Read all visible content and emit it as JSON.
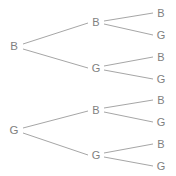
{
  "diagram": {
    "type": "binary-probability-tree",
    "background_color": "#ffffff",
    "text_color": "#7f7f7f",
    "edge_color": "#a6a6a6",
    "depth": 2,
    "branching_factor": 2,
    "outcome_symbols": [
      "B",
      "G"
    ],
    "nodes": [
      {
        "id": "r1",
        "label": "B",
        "level": 0,
        "x": 14,
        "y": 46,
        "class": "node-root"
      },
      {
        "id": "r2",
        "label": "G",
        "level": 0,
        "x": 14,
        "y": 130,
        "class": "node-root"
      },
      {
        "id": "m1",
        "label": "B",
        "level": 1,
        "x": 96,
        "y": 22,
        "class": "node-mid"
      },
      {
        "id": "m2",
        "label": "G",
        "level": 1,
        "x": 96,
        "y": 68,
        "class": "node-mid"
      },
      {
        "id": "m3",
        "label": "B",
        "level": 1,
        "x": 96,
        "y": 110,
        "class": "node-mid"
      },
      {
        "id": "m4",
        "label": "G",
        "level": 1,
        "x": 96,
        "y": 155,
        "class": "node-mid"
      },
      {
        "id": "l1",
        "label": "B",
        "level": 2,
        "x": 161,
        "y": 13,
        "class": "node-leaf"
      },
      {
        "id": "l2",
        "label": "G",
        "level": 2,
        "x": 161,
        "y": 35,
        "class": "node-leaf"
      },
      {
        "id": "l3",
        "label": "B",
        "level": 2,
        "x": 161,
        "y": 57,
        "class": "node-leaf"
      },
      {
        "id": "l4",
        "label": "G",
        "level": 2,
        "x": 161,
        "y": 79,
        "class": "node-leaf"
      },
      {
        "id": "l5",
        "label": "B",
        "level": 2,
        "x": 161,
        "y": 100,
        "class": "node-leaf"
      },
      {
        "id": "l6",
        "label": "G",
        "level": 2,
        "x": 161,
        "y": 122,
        "class": "node-leaf"
      },
      {
        "id": "l7",
        "label": "B",
        "level": 2,
        "x": 161,
        "y": 144,
        "class": "node-leaf"
      },
      {
        "id": "l8",
        "label": "G",
        "level": 2,
        "x": 161,
        "y": 166,
        "class": "node-leaf"
      }
    ],
    "edges": [
      {
        "from": "r1",
        "to": "m1",
        "x1": 23,
        "y1": 44,
        "x2": 88,
        "y2": 23
      },
      {
        "from": "r1",
        "to": "m2",
        "x1": 23,
        "y1": 49,
        "x2": 88,
        "y2": 68
      },
      {
        "from": "r2",
        "to": "m3",
        "x1": 23,
        "y1": 128,
        "x2": 88,
        "y2": 111
      },
      {
        "from": "r2",
        "to": "m4",
        "x1": 23,
        "y1": 133,
        "x2": 88,
        "y2": 155
      },
      {
        "from": "m1",
        "to": "l1",
        "x1": 104,
        "y1": 21,
        "x2": 153,
        "y2": 13
      },
      {
        "from": "m1",
        "to": "l2",
        "x1": 104,
        "y1": 24,
        "x2": 153,
        "y2": 35
      },
      {
        "from": "m2",
        "to": "l3",
        "x1": 104,
        "y1": 66,
        "x2": 153,
        "y2": 57
      },
      {
        "from": "m2",
        "to": "l4",
        "x1": 104,
        "y1": 70,
        "x2": 153,
        "y2": 79
      },
      {
        "from": "m3",
        "to": "l5",
        "x1": 104,
        "y1": 108,
        "x2": 153,
        "y2": 100
      },
      {
        "from": "m3",
        "to": "l6",
        "x1": 104,
        "y1": 112,
        "x2": 153,
        "y2": 122
      },
      {
        "from": "m4",
        "to": "l7",
        "x1": 104,
        "y1": 153,
        "x2": 153,
        "y2": 144
      },
      {
        "from": "m4",
        "to": "l8",
        "x1": 104,
        "y1": 157,
        "x2": 153,
        "y2": 166
      }
    ]
  }
}
